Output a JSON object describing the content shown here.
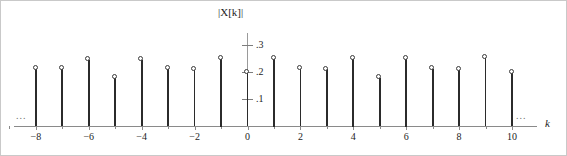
{
  "figure": {
    "name": "dtfs-magnitude-spectrum",
    "ellipsis_left": "...",
    "ellipsis_right": "..."
  },
  "chart_data": {
    "type": "bar",
    "style": "stem-plot",
    "title": "",
    "xlabel": "k",
    "ylabel": "|X[k]|",
    "xlim": [
      -9.3,
      11.0
    ],
    "ylim": [
      0,
      0.33
    ],
    "grid": false,
    "legend": null,
    "x_tick_labels": [
      "−8",
      "−6",
      "−4",
      "−2",
      "0",
      "2",
      "4",
      "6",
      "8",
      "10"
    ],
    "x_tick_values": [
      -8,
      -6,
      -4,
      -2,
      0,
      2,
      4,
      6,
      8,
      10
    ],
    "x_minor_ticks": [
      -9,
      -7,
      -5,
      -3,
      -1,
      1,
      3,
      5,
      7,
      9
    ],
    "y_tick_labels": [
      ".1",
      ".2",
      ".3"
    ],
    "y_tick_values": [
      0.1,
      0.2,
      0.3
    ],
    "categories": [
      -8,
      -7,
      -6,
      -5,
      -4,
      -3,
      -2,
      -1,
      0,
      1,
      2,
      3,
      4,
      5,
      6,
      7,
      8,
      9,
      10
    ],
    "values": [
      0.215,
      0.212,
      0.245,
      0.18,
      0.245,
      0.212,
      0.21,
      0.25,
      0.2,
      0.25,
      0.212,
      0.21,
      0.25,
      0.18,
      0.25,
      0.212,
      0.21,
      0.252,
      0.2
    ],
    "marker": "open-circle",
    "annotations": [
      {
        "text": "...",
        "position": "left-of-axis"
      },
      {
        "text": "...",
        "position": "right-of-axis"
      }
    ]
  }
}
